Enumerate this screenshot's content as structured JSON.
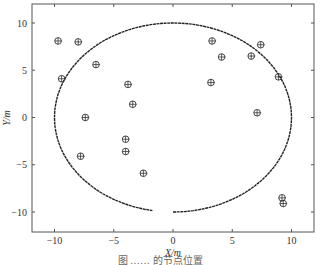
{
  "chart_data": {
    "type": "scatter",
    "title": "",
    "xlabel": "X/m",
    "ylabel": "Y/m",
    "xlim": [
      -12,
      12
    ],
    "ylim": [
      -12,
      12
    ],
    "xticks": [
      -10,
      -5,
      0,
      5,
      10
    ],
    "yticks": [
      -10,
      -5,
      0,
      5,
      10
    ],
    "grid": false,
    "series": [
      {
        "name": "points",
        "marker": "circle-plus",
        "points": [
          {
            "x": -9.7,
            "y": 8.1
          },
          {
            "x": -8.0,
            "y": 8.0
          },
          {
            "x": -6.5,
            "y": 5.6
          },
          {
            "x": -9.4,
            "y": 4.1
          },
          {
            "x": -7.4,
            "y": 0.0
          },
          {
            "x": -7.8,
            "y": -4.1
          },
          {
            "x": -3.8,
            "y": 3.5
          },
          {
            "x": -3.4,
            "y": 1.4
          },
          {
            "x": -4.0,
            "y": -2.3
          },
          {
            "x": -4.0,
            "y": -3.6
          },
          {
            "x": -2.5,
            "y": -5.9
          },
          {
            "x": 3.3,
            "y": 8.1
          },
          {
            "x": 4.1,
            "y": 6.4
          },
          {
            "x": 3.2,
            "y": 3.7
          },
          {
            "x": 6.6,
            "y": 6.5
          },
          {
            "x": 7.4,
            "y": 7.7
          },
          {
            "x": 8.9,
            "y": 4.3
          },
          {
            "x": 7.1,
            "y": 0.5
          },
          {
            "x": 9.2,
            "y": -8.5
          },
          {
            "x": 9.3,
            "y": -9.1
          }
        ]
      },
      {
        "name": "boundary",
        "type": "line",
        "shape": "circle-arc",
        "center": [
          0,
          0
        ],
        "radius": 10,
        "start_angle_deg": -90,
        "end_angle_deg": 260
      }
    ]
  },
  "caption": "图    ……  的节点位置"
}
